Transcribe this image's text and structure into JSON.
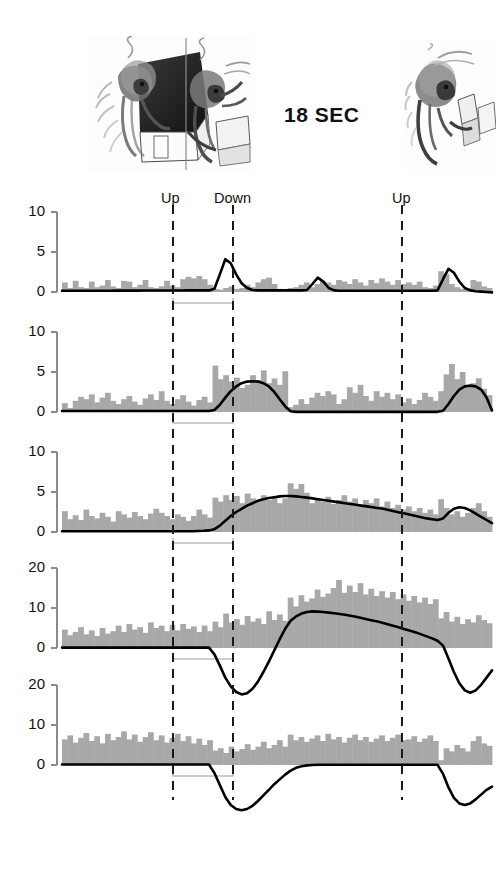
{
  "figure": {
    "time_scale_label": "18 SEC",
    "illustration_left_name": "monkey-reaching-into-box-sketch",
    "illustration_right_name": "monkey-at-table-sketch",
    "histogram_color": "#a8a8a8",
    "curve_color": "#000000",
    "axis_color": "#8a8a8a",
    "event_line_color": "#1a1a1a"
  },
  "events": [
    {
      "label": "Up",
      "x": 173,
      "label_x": 161,
      "label_y": 190
    },
    {
      "label": "Down",
      "x": 233,
      "label_x": 214,
      "label_y": 190
    },
    {
      "label": "Up",
      "x": 402,
      "label_x": 392,
      "label_y": 190
    }
  ],
  "chart_data": {
    "type": "bar",
    "title": "",
    "subtitle": "",
    "xlabel": "",
    "ylabel": "",
    "time_scale_label": "18 SEC",
    "event_markers": [
      "Up",
      "Down",
      "Up"
    ],
    "event_marker_x": [
      173,
      233,
      402
    ],
    "grid": false,
    "legend": "none",
    "panels": [
      {
        "name": "panel-1",
        "yticks": [
          0,
          5,
          10
        ],
        "ylim": [
          -2,
          10
        ],
        "bar_width": 5.6,
        "values": [
          1.2,
          0.5,
          1.4,
          0.6,
          0.5,
          1.3,
          0.6,
          0.8,
          1.5,
          0.7,
          0.5,
          1.4,
          1.3,
          0.6,
          0.9,
          1.5,
          0.6,
          0.5,
          0.7,
          1.4,
          0.8,
          0.6,
          1.6,
          1.9,
          1.7,
          2.0,
          1.6,
          0.9,
          0.4,
          0.3,
          0.5,
          0.7,
          0.4,
          0.5,
          0.9,
          0.6,
          1.2,
          1.6,
          1.8,
          1.0,
          0.4,
          0.3,
          0.5,
          0.6,
          0.9,
          1.2,
          0.6,
          1.0,
          1.4,
          1.2,
          0.9,
          1.5,
          1.3,
          1.0,
          1.6,
          1.2,
          0.8,
          1.5,
          1.1,
          1.7,
          1.3,
          0.9,
          1.5,
          1.0,
          1.2,
          0.9,
          1.3,
          0.6,
          0.5,
          0.8,
          2.6,
          2.2,
          1.0,
          0.6,
          0.4,
          0.5,
          1.5,
          1.3,
          0.7,
          0.5
        ],
        "curve": [
          0.15,
          0.15,
          0.15,
          0.15,
          0.15,
          0.16,
          0.16,
          0.16,
          0.16,
          0.16,
          0.17,
          0.17,
          0.17,
          0.17,
          0.17,
          0.18,
          0.18,
          0.18,
          0.18,
          0.18,
          0.19,
          0.19,
          0.19,
          0.2,
          0.2,
          0.2,
          0.2,
          0.2,
          0.4,
          2.2,
          4.1,
          3.6,
          2.2,
          1.1,
          0.5,
          0.25,
          0.2,
          0.2,
          0.2,
          0.2,
          0.2,
          0.2,
          0.2,
          0.2,
          0.2,
          0.25,
          1.0,
          1.8,
          1.3,
          0.5,
          0.2,
          0.15,
          0.15,
          0.15,
          0.15,
          0.15,
          0.15,
          0.15,
          0.15,
          0.15,
          0.15,
          0.15,
          0.15,
          0.15,
          0.15,
          0.15,
          0.15,
          0.15,
          0.15,
          0.2,
          1.6,
          2.9,
          2.4,
          1.3,
          0.5,
          0.2,
          0.1,
          0.05,
          0.0,
          -0.05
        ]
      },
      {
        "name": "panel-2",
        "yticks": [
          0,
          5,
          10
        ],
        "ylim": [
          -2,
          10
        ],
        "bar_width": 5.6,
        "values": [
          1.1,
          0.5,
          1.4,
          1.9,
          1.6,
          2.2,
          1.2,
          1.8,
          2.4,
          1.4,
          1.0,
          1.6,
          2.0,
          1.3,
          0.9,
          1.7,
          2.2,
          1.5,
          2.6,
          1.4,
          1.0,
          1.6,
          2.1,
          1.3,
          0.8,
          1.5,
          1.9,
          1.2,
          5.8,
          4.1,
          4.6,
          3.8,
          4.3,
          3.0,
          3.4,
          4.6,
          4.0,
          5.2,
          3.6,
          4.2,
          3.4,
          5.1,
          0.6,
          0.9,
          1.6,
          1.0,
          1.8,
          2.4,
          2.0,
          2.6,
          2.2,
          1.0,
          1.6,
          3.1,
          2.4,
          3.4,
          2.0,
          1.4,
          2.6,
          1.9,
          2.4,
          1.6,
          2.2,
          1.2,
          1.7,
          1.0,
          1.5,
          2.4,
          1.9,
          1.4,
          2.6,
          4.7,
          6.0,
          4.1,
          5.0,
          3.1,
          3.6,
          4.2,
          2.9,
          2.1
        ],
        "curve": [
          0.12,
          0.12,
          0.12,
          0.12,
          0.12,
          0.12,
          0.12,
          0.12,
          0.12,
          0.12,
          0.12,
          0.12,
          0.12,
          0.12,
          0.12,
          0.12,
          0.12,
          0.12,
          0.12,
          0.12,
          0.12,
          0.12,
          0.12,
          0.12,
          0.12,
          0.12,
          0.12,
          0.12,
          0.25,
          0.9,
          1.8,
          2.6,
          3.2,
          3.6,
          3.8,
          3.85,
          3.8,
          3.6,
          3.2,
          2.5,
          1.6,
          0.7,
          0.1,
          0.02,
          0.02,
          0.02,
          0.02,
          0.02,
          0.02,
          0.02,
          0.02,
          0.02,
          0.02,
          0.02,
          0.02,
          0.02,
          0.02,
          0.02,
          0.02,
          0.02,
          0.02,
          0.02,
          0.02,
          0.02,
          0.02,
          0.02,
          0.02,
          0.02,
          0.02,
          0.02,
          0.15,
          1.0,
          2.0,
          2.8,
          3.2,
          3.3,
          3.2,
          2.8,
          1.8,
          0.2
        ]
      },
      {
        "name": "panel-3",
        "yticks": [
          0,
          5,
          10
        ],
        "ylim": [
          -2,
          10
        ],
        "bar_width": 5.6,
        "values": [
          2.6,
          1.6,
          2.1,
          1.5,
          2.8,
          2.0,
          1.7,
          2.4,
          1.9,
          1.3,
          2.6,
          2.2,
          1.8,
          2.5,
          2.0,
          1.6,
          2.3,
          2.9,
          2.4,
          2.0,
          1.6,
          2.2,
          1.9,
          1.4,
          2.0,
          2.8,
          2.2,
          1.8,
          4.3,
          3.8,
          4.6,
          4.0,
          4.5,
          3.6,
          4.8,
          4.2,
          3.9,
          4.6,
          4.0,
          4.4,
          3.6,
          4.2,
          6.1,
          5.4,
          6.0,
          4.9,
          3.6,
          4.2,
          3.8,
          4.4,
          3.5,
          4.0,
          4.6,
          3.8,
          4.2,
          3.4,
          4.0,
          3.6,
          4.2,
          3.2,
          3.8,
          3.0,
          3.4,
          2.8,
          3.2,
          2.6,
          3.0,
          2.4,
          2.8,
          2.2,
          4.1,
          3.0,
          2.2,
          2.6,
          1.9,
          2.4,
          3.0,
          3.6,
          2.6,
          1.9
        ],
        "curve": [
          0.1,
          0.1,
          0.1,
          0.1,
          0.1,
          0.1,
          0.1,
          0.1,
          0.1,
          0.1,
          0.1,
          0.1,
          0.1,
          0.1,
          0.1,
          0.1,
          0.1,
          0.1,
          0.1,
          0.1,
          0.1,
          0.1,
          0.1,
          0.1,
          0.1,
          0.12,
          0.15,
          0.2,
          0.35,
          0.8,
          1.4,
          2.0,
          2.5,
          2.9,
          3.3,
          3.6,
          3.9,
          4.1,
          4.25,
          4.35,
          4.45,
          4.5,
          4.5,
          4.45,
          4.38,
          4.3,
          4.2,
          4.1,
          4.0,
          3.9,
          3.8,
          3.7,
          3.6,
          3.5,
          3.4,
          3.3,
          3.2,
          3.1,
          3.0,
          2.9,
          2.75,
          2.6,
          2.45,
          2.3,
          2.15,
          2.0,
          1.85,
          1.7,
          1.6,
          1.5,
          1.7,
          2.4,
          2.9,
          3.1,
          3.0,
          2.7,
          2.3,
          1.9,
          1.5,
          1.1
        ]
      },
      {
        "name": "panel-4",
        "yticks": [
          0,
          10,
          20
        ],
        "ylim": [
          -14,
          20
        ],
        "bar_width": 5.6,
        "values": [
          4.6,
          3.2,
          4.0,
          5.2,
          3.4,
          4.4,
          3.0,
          5.0,
          3.6,
          4.2,
          5.6,
          4.0,
          6.0,
          4.6,
          5.2,
          3.8,
          6.4,
          5.0,
          5.6,
          4.2,
          5.8,
          4.4,
          6.0,
          4.8,
          5.4,
          4.0,
          5.6,
          4.2,
          6.6,
          5.2,
          8.6,
          6.4,
          7.2,
          5.8,
          8.0,
          6.6,
          7.4,
          6.0,
          9.2,
          7.0,
          8.4,
          6.8,
          12.6,
          10.4,
          13.2,
          11.6,
          12.4,
          14.6,
          12.8,
          13.6,
          15.0,
          17.0,
          13.8,
          15.6,
          14.0,
          16.2,
          13.4,
          14.8,
          13.0,
          14.2,
          12.6,
          14.0,
          12.2,
          13.4,
          11.8,
          13.0,
          11.4,
          12.6,
          11.0,
          12.2,
          7.4,
          9.0,
          6.6,
          7.8,
          6.0,
          7.2,
          6.4,
          8.2,
          7.0,
          6.2
        ],
        "curve": [
          0.1,
          0.1,
          0.1,
          0.1,
          0.1,
          0.1,
          0.1,
          0.1,
          0.1,
          0.1,
          0.1,
          0.1,
          0.1,
          0.1,
          0.1,
          0.1,
          0.1,
          0.1,
          0.1,
          0.1,
          0.1,
          0.1,
          0.1,
          0.1,
          0.1,
          0.1,
          0.1,
          0.1,
          -1.6,
          -4.4,
          -7.4,
          -9.6,
          -11.0,
          -11.6,
          -11.3,
          -10.2,
          -8.4,
          -6.0,
          -3.4,
          -0.6,
          2.2,
          4.8,
          6.8,
          7.9,
          8.6,
          9.0,
          9.15,
          9.1,
          9.0,
          8.85,
          8.7,
          8.5,
          8.3,
          8.05,
          7.8,
          7.5,
          7.2,
          6.9,
          6.6,
          6.25,
          5.9,
          5.5,
          5.1,
          4.7,
          4.3,
          3.9,
          3.4,
          2.9,
          2.4,
          1.8,
          0.6,
          -2.6,
          -6.0,
          -8.8,
          -10.6,
          -11.2,
          -10.6,
          -9.2,
          -7.4,
          -5.6
        ]
      },
      {
        "name": "panel-5",
        "yticks": [
          0,
          10,
          20
        ],
        "ylim": [
          -14,
          20
        ],
        "bar_width": 5.6,
        "values": [
          6.4,
          7.4,
          5.6,
          6.8,
          8.0,
          6.0,
          7.2,
          5.4,
          7.8,
          6.2,
          7.0,
          8.4,
          6.4,
          7.6,
          5.8,
          7.0,
          8.2,
          6.2,
          7.4,
          5.6,
          6.8,
          7.8,
          6.0,
          7.2,
          5.4,
          6.6,
          5.0,
          6.2,
          3.6,
          4.2,
          3.0,
          4.6,
          3.4,
          4.0,
          5.2,
          3.8,
          4.6,
          5.8,
          4.2,
          5.0,
          6.2,
          4.6,
          7.6,
          6.2,
          7.0,
          5.8,
          6.6,
          7.4,
          6.0,
          7.8,
          6.4,
          7.0,
          5.6,
          6.8,
          7.6,
          6.2,
          7.0,
          5.8,
          6.6,
          7.4,
          6.0,
          6.8,
          7.6,
          6.2,
          6.4,
          7.2,
          5.8,
          6.6,
          7.4,
          6.0,
          1.2,
          4.2,
          3.4,
          5.0,
          4.2,
          3.4,
          6.0,
          7.2,
          5.4,
          4.8
        ],
        "curve": [
          0.12,
          0.12,
          0.12,
          0.12,
          0.12,
          0.12,
          0.12,
          0.12,
          0.12,
          0.12,
          0.12,
          0.12,
          0.12,
          0.12,
          0.12,
          0.12,
          0.12,
          0.12,
          0.12,
          0.12,
          0.12,
          0.12,
          0.12,
          0.12,
          0.12,
          0.12,
          0.12,
          0.12,
          -2.0,
          -5.0,
          -8.0,
          -10.0,
          -11.0,
          -11.3,
          -11.0,
          -10.2,
          -9.0,
          -7.6,
          -6.2,
          -4.8,
          -3.6,
          -2.4,
          -1.4,
          -0.7,
          -0.3,
          -0.1,
          0.0,
          0.05,
          0.05,
          0.05,
          0.05,
          0.05,
          0.05,
          0.05,
          0.05,
          0.05,
          0.05,
          0.05,
          0.05,
          0.05,
          0.05,
          0.05,
          0.05,
          0.05,
          0.05,
          0.05,
          0.05,
          0.05,
          0.05,
          0.05,
          -2.2,
          -5.6,
          -8.2,
          -9.6,
          -10.0,
          -9.6,
          -8.6,
          -7.4,
          -6.2,
          -5.4
        ]
      }
    ]
  }
}
